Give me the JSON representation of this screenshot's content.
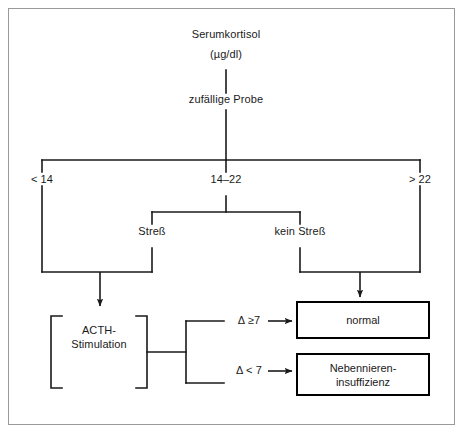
{
  "diagram": {
    "title_text": "Serumkortisol",
    "units_text": "(µg/dl)",
    "sample_text": "zufällige Probe",
    "branch_low": "< 14",
    "branch_mid": "14–22",
    "branch_high": "> 22",
    "stress_yes": "Streß",
    "stress_no": "kein Streß",
    "acth_line1": "ACTH-",
    "acth_line2": "Stimulation",
    "delta_high": "Δ ≥7",
    "delta_low": "Δ < 7",
    "result_normal": "normal",
    "result_insuff_line1": "Nebennieren-",
    "result_insuff_line2": "insuffizienz",
    "line_color": "#1a1a1a",
    "box_border_color": "#000000",
    "frame_color": "#9a9a9a",
    "background_color": "#ffffff"
  }
}
